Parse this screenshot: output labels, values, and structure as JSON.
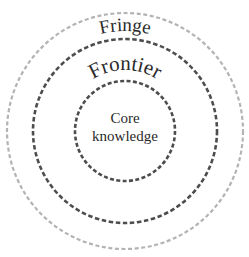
{
  "diagram": {
    "type": "concentric-circles",
    "center": {
      "x": 125,
      "y": 131
    },
    "rings": [
      {
        "id": "fringe",
        "label": "Fringe",
        "radius": 118,
        "stroke_color": "#b3b3b3",
        "stroke_width": 2.2,
        "dash": "4 2.6",
        "font_size": 19,
        "label_radius": 100
      },
      {
        "id": "frontier",
        "label": "Frontier",
        "radius": 92,
        "stroke_color": "#4d4d4d",
        "stroke_width": 2.6,
        "dash": "4.5 2.6",
        "font_size": 21,
        "label_radius": 61
      },
      {
        "id": "core",
        "label_lines": [
          "Core",
          "knowledge"
        ],
        "radius": 50,
        "stroke_color": "#4d4d4d",
        "stroke_width": 2.6,
        "dash": "4 2.4",
        "font_size": 15
      }
    ]
  }
}
